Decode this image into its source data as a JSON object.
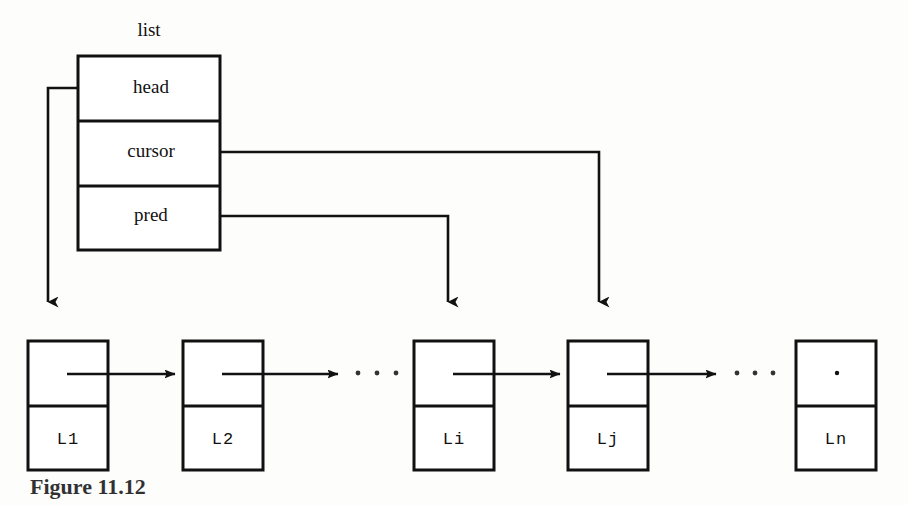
{
  "figure": {
    "caption": "Figure 11.12",
    "struct_title": "list"
  },
  "struct_box": {
    "name": "list",
    "fields": [
      {
        "label": "head",
        "target": "L1"
      },
      {
        "label": "cursor",
        "target": "Lj"
      },
      {
        "label": "pred",
        "target": "Li"
      }
    ]
  },
  "nodes": [
    {
      "label": "L1",
      "next": "L2",
      "null_marker": false
    },
    {
      "label": "L2",
      "next": "...",
      "null_marker": false
    },
    {
      "label": "Li",
      "next": "Lj",
      "null_marker": false
    },
    {
      "label": "Lj",
      "next": "...",
      "null_marker": false
    },
    {
      "label": "Ln",
      "next": null,
      "null_marker": true
    }
  ],
  "ellipses": [
    {
      "after": "L2",
      "text": "..."
    },
    {
      "after": "Lj",
      "text": "..."
    }
  ],
  "colors": {
    "ink": "#111111",
    "paper": "#fdfdfc",
    "null_dot": "#111111"
  }
}
